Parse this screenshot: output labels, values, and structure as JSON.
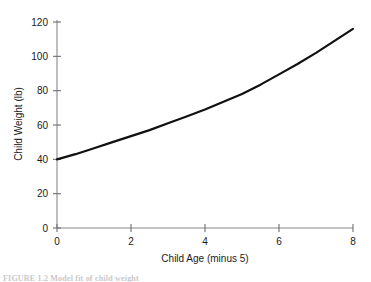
{
  "chart_data": {
    "type": "line",
    "title": "",
    "xlabel": "Child Age (minus 5)",
    "ylabel": "Child Weight (lb)",
    "xlim": [
      0,
      8
    ],
    "ylim": [
      0,
      120
    ],
    "xticks": [
      "0",
      "2",
      "4",
      "6",
      "8"
    ],
    "xtick_values": [
      0,
      2,
      4,
      6,
      8
    ],
    "yticks": [
      "0",
      "20",
      "40",
      "60",
      "80",
      "100",
      "120"
    ],
    "ytick_values": [
      0,
      20,
      40,
      60,
      80,
      100,
      120
    ],
    "grid": false,
    "legend": "none",
    "series": [
      {
        "name": "Child Weight",
        "color": "#111111",
        "x": [
          0,
          0.5,
          1,
          1.5,
          2,
          2.5,
          3,
          3.5,
          4,
          4.5,
          5,
          5.5,
          6,
          6.5,
          7,
          7.5,
          8
        ],
        "values": [
          40,
          43,
          46.5,
          50,
          53.5,
          57,
          61,
          65,
          69,
          73.5,
          78,
          83.5,
          89.5,
          95.5,
          102,
          109,
          116
        ]
      }
    ]
  },
  "axes": {
    "x_axis_label": "Child Age (minus 5)",
    "y_axis_label": "Child Weight (lb)"
  },
  "caption": {
    "text": "FIGURE 1.2   Model fit of child weight"
  }
}
